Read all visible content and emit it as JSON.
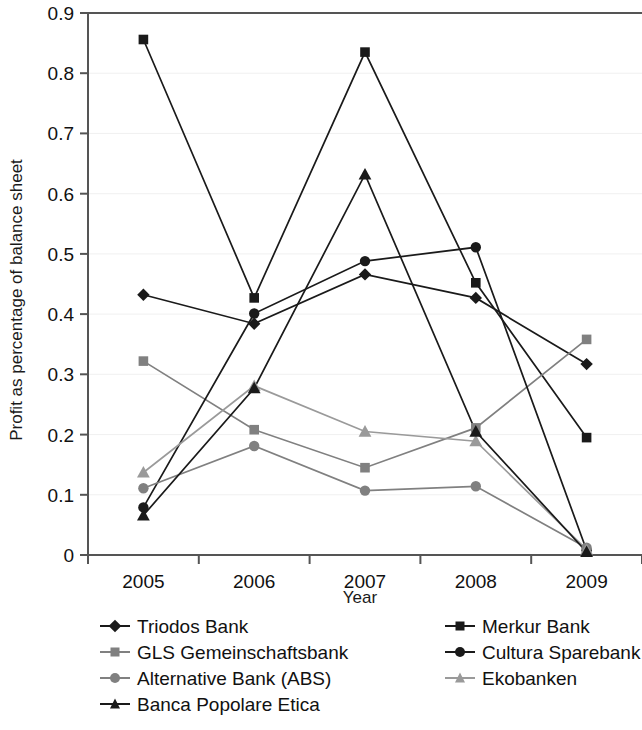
{
  "chart_data": {
    "type": "line",
    "title": "",
    "xlabel": "Year",
    "ylabel": "Profit as percentage of balance sheet",
    "categories": [
      "2005",
      "2006",
      "2007",
      "2008",
      "2009"
    ],
    "x_tick_labels": [
      "2005",
      "2006",
      "2007",
      "2008",
      "2009"
    ],
    "y_tick_labels": [
      "0",
      "0.1",
      "0.2",
      "0.3",
      "0.4",
      "0.5",
      "0.6",
      "0.7",
      "0.8",
      "0.9"
    ],
    "y_tick_values": [
      0,
      0.1,
      0.2,
      0.3,
      0.4,
      0.5,
      0.6,
      0.7,
      0.8,
      0.9
    ],
    "ylim": [
      0,
      0.9
    ],
    "grid": "horizontal-light",
    "legend_position": "below-plot-two-columns",
    "series": [
      {
        "name": "Triodos Bank",
        "marker": "diamond",
        "color": "#1a1a1a",
        "values": [
          0.432,
          0.384,
          0.466,
          0.427,
          0.317
        ]
      },
      {
        "name": "Merkur Bank",
        "marker": "square",
        "color": "#1a1a1a",
        "values": [
          0.856,
          0.427,
          0.835,
          0.452,
          0.195
        ]
      },
      {
        "name": "GLS Gemeinschaftsbank",
        "marker": "square",
        "color": "#808080",
        "values": [
          0.322,
          0.208,
          0.145,
          0.211,
          0.358
        ]
      },
      {
        "name": "Cultura Sparebank",
        "marker": "circle",
        "color": "#1a1a1a",
        "values": [
          0.079,
          0.401,
          0.488,
          0.511,
          0.008
        ]
      },
      {
        "name": "Alternative Bank (ABS)",
        "marker": "circle",
        "color": "#808080",
        "values": [
          0.111,
          0.181,
          0.107,
          0.114,
          0.012
        ]
      },
      {
        "name": "Ekobanken",
        "marker": "triangle",
        "color": "#9a9a9a",
        "values": [
          0.137,
          0.281,
          0.205,
          0.189,
          0.009
        ]
      },
      {
        "name": "Banca Popolare Etica",
        "marker": "triangle",
        "color": "#1a1a1a",
        "values": [
          0.066,
          0.277,
          0.632,
          0.205,
          0.005
        ]
      }
    ]
  },
  "legend": {
    "left_column": [
      "Triodos Bank",
      "GLS Gemeinschaftsbank",
      "Alternative Bank (ABS)",
      "Banca Popolare Etica"
    ],
    "right_column": [
      "Merkur Bank",
      "Cultura Sparebank",
      "Ekobanken"
    ]
  },
  "colors": {
    "dark": "#1a1a1a",
    "grey": "#808080",
    "light_grey": "#9a9a9a",
    "grid": "#f0f0f0",
    "axis": "#555555"
  }
}
